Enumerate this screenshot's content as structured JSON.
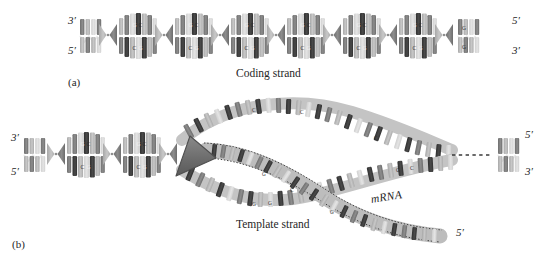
{
  "figure": {
    "title_visible": false,
    "background": "#ffffff",
    "ink": "#3a3a3a"
  },
  "palette": {
    "base_dark": "#3f3f3f",
    "base_mid": "#7d7d7d",
    "base_light": "#b8b8b8",
    "base_pale": "#d6d6d6",
    "backbone": "#9a9a9a",
    "polymerase": "#6e6e6e",
    "outline": "#4a4a4a",
    "text": "#262626"
  },
  "panels": [
    {
      "id": "a",
      "label": "(a)",
      "caption": "Coding strand",
      "ends": [
        {
          "name": "left-top",
          "text": "3′"
        },
        {
          "name": "left-bottom",
          "text": "5′"
        },
        {
          "name": "right-top",
          "text": "5′"
        },
        {
          "name": "right-bottom",
          "text": "3′"
        }
      ],
      "helix": {
        "type": "double-helix",
        "turns": 6,
        "bases_visible": [
          "G",
          "C",
          "G",
          "C",
          "C",
          "G",
          "G",
          "C",
          "C",
          "G"
        ]
      }
    },
    {
      "id": "b",
      "label": "(b)",
      "caption": "Template strand",
      "transcript_label": "mRNA",
      "ends": [
        {
          "name": "left-top",
          "text": "3′"
        },
        {
          "name": "left-bottom",
          "text": "5′"
        },
        {
          "name": "right-top",
          "text": "5′"
        },
        {
          "name": "right-bottom",
          "text": "3′"
        },
        {
          "name": "mrna-end",
          "text": "5′"
        }
      ],
      "helix": {
        "type": "double-helix-with-transcription-bubble",
        "turns_left": 3,
        "bases_visible": [
          "G",
          "C",
          "G",
          "C",
          "G",
          "C",
          "C",
          "G"
        ]
      },
      "polymerase": {
        "shape": "wedge-triangle",
        "fill": "#6e6e6e"
      },
      "gap": {
        "style": "dashed-line",
        "meaning": "continuation"
      }
    }
  ],
  "icons": {
    "polymerase": "wedge-icon",
    "dash_break": "dashed-break-icon"
  }
}
